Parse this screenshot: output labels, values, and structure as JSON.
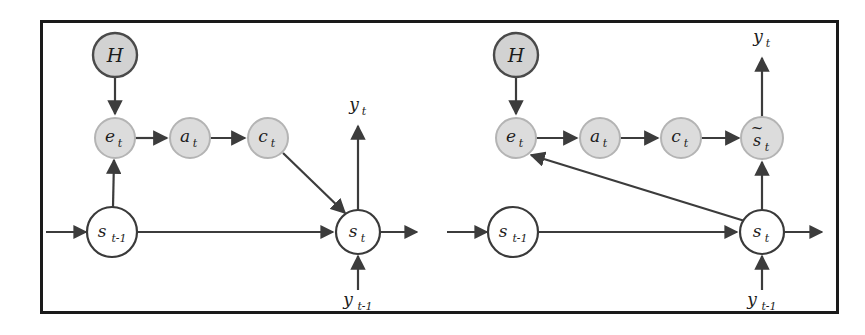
{
  "figure": {
    "frame": {
      "stroke_color": "#1a1a1a",
      "background": "#ffffff"
    },
    "style": {
      "shaded_node_fill": "#dcdcdc",
      "shaded_node_stroke": "#b4b4b4",
      "dark_node_fill": "#d2d2d2",
      "dark_node_stroke": "#4a4a4a",
      "open_node_fill": "#ffffff",
      "open_node_stroke": "#3a3a3a",
      "edge_color": "#3c3c3c"
    },
    "panels": [
      {
        "id": "left-panel",
        "name": "panel-left",
        "nodes": [
          {
            "id": "L-H",
            "label": "H",
            "sub": "",
            "tilde": false,
            "shaded": "dark",
            "cx": 115,
            "cy": 55,
            "r": 22
          },
          {
            "id": "L-e",
            "label": "e",
            "sub": "t",
            "tilde": false,
            "shaded": "light",
            "cx": 115,
            "cy": 138,
            "r": 20
          },
          {
            "id": "L-a",
            "label": "a",
            "sub": "t",
            "tilde": false,
            "shaded": "light",
            "cx": 190,
            "cy": 138,
            "r": 20
          },
          {
            "id": "L-c",
            "label": "c",
            "sub": "t",
            "tilde": false,
            "shaded": "light",
            "cx": 268,
            "cy": 138,
            "r": 20
          },
          {
            "id": "L-sprev",
            "label": "s",
            "sub": "t-1",
            "tilde": false,
            "shaded": "open",
            "cx": 112,
            "cy": 232,
            "r": 25
          },
          {
            "id": "L-s",
            "label": "s",
            "sub": "t",
            "tilde": false,
            "shaded": "open",
            "cx": 358,
            "cy": 232,
            "r": 22
          }
        ],
        "free_labels": [
          {
            "id": "L-yt",
            "label": "y",
            "sub": "t",
            "x": 358,
            "y": 110
          },
          {
            "id": "L-ytm1",
            "label": "y",
            "sub": "t-1",
            "x": 358,
            "y": 305
          }
        ],
        "edges": [
          {
            "from": "L-H",
            "to": "L-e",
            "kind": "vertical-down"
          },
          {
            "from": "L-sprev",
            "to": "L-e",
            "kind": "vertical-up"
          },
          {
            "from": "L-e",
            "to": "L-a",
            "kind": "horizontal"
          },
          {
            "from": "L-a",
            "to": "L-c",
            "kind": "horizontal"
          },
          {
            "from": "L-c",
            "to": "L-s",
            "kind": "diagonal-down-right"
          },
          {
            "from": "L-sprev",
            "to": "L-s",
            "kind": "horizontal"
          },
          {
            "from": "edge-in",
            "to": "L-sprev",
            "kind": "horizontal-inbound"
          },
          {
            "from": "L-s",
            "to": "edge-out",
            "kind": "horizontal-outbound"
          },
          {
            "from": "L-s",
            "to": "L-yt",
            "kind": "vertical-up-emit"
          },
          {
            "from": "L-ytm1",
            "to": "L-s",
            "kind": "vertical-up-feed"
          }
        ]
      },
      {
        "id": "right-panel",
        "name": "panel-right",
        "nodes": [
          {
            "id": "R-H",
            "label": "H",
            "sub": "",
            "tilde": false,
            "shaded": "dark",
            "cx": 516,
            "cy": 55,
            "r": 22
          },
          {
            "id": "R-e",
            "label": "e",
            "sub": "t",
            "tilde": false,
            "shaded": "light",
            "cx": 516,
            "cy": 138,
            "r": 20
          },
          {
            "id": "R-a",
            "label": "a",
            "sub": "t",
            "tilde": false,
            "shaded": "light",
            "cx": 600,
            "cy": 138,
            "r": 20
          },
          {
            "id": "R-c",
            "label": "c",
            "sub": "t",
            "tilde": false,
            "shaded": "light",
            "cx": 681,
            "cy": 138,
            "r": 20
          },
          {
            "id": "R-stil",
            "label": "s",
            "sub": "t",
            "tilde": true,
            "shaded": "light",
            "cx": 762,
            "cy": 138,
            "r": 21
          },
          {
            "id": "R-sprev",
            "label": "s",
            "sub": "t-1",
            "tilde": false,
            "shaded": "open",
            "cx": 513,
            "cy": 232,
            "r": 25
          },
          {
            "id": "R-s",
            "label": "s",
            "sub": "t",
            "tilde": false,
            "shaded": "open",
            "cx": 762,
            "cy": 232,
            "r": 22
          }
        ],
        "free_labels": [
          {
            "id": "R-yt",
            "label": "y",
            "sub": "t",
            "x": 762,
            "y": 42
          },
          {
            "id": "R-ytm1",
            "label": "y",
            "sub": "t-1",
            "x": 762,
            "y": 305
          }
        ],
        "edges": [
          {
            "from": "R-H",
            "to": "R-e",
            "kind": "vertical-down"
          },
          {
            "from": "R-e",
            "to": "R-a",
            "kind": "horizontal"
          },
          {
            "from": "R-a",
            "to": "R-c",
            "kind": "horizontal"
          },
          {
            "from": "R-c",
            "to": "R-stil",
            "kind": "horizontal"
          },
          {
            "from": "R-s",
            "to": "R-e",
            "kind": "diagonal-up-left"
          },
          {
            "from": "R-s",
            "to": "R-stil",
            "kind": "vertical-up"
          },
          {
            "from": "R-sprev",
            "to": "R-s",
            "kind": "horizontal"
          },
          {
            "from": "edge-in",
            "to": "R-sprev",
            "kind": "horizontal-inbound"
          },
          {
            "from": "R-s",
            "to": "edge-out",
            "kind": "horizontal-outbound"
          },
          {
            "from": "R-stil",
            "to": "R-yt",
            "kind": "vertical-up-emit"
          },
          {
            "from": "R-ytm1",
            "to": "R-s",
            "kind": "vertical-up-feed"
          }
        ]
      }
    ]
  }
}
